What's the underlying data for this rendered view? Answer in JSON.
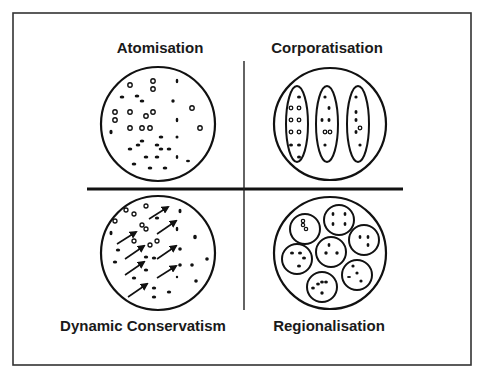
{
  "diagram": {
    "quadrants": [
      {
        "id": "top-left",
        "title": "Atomisation"
      },
      {
        "id": "top-right",
        "title": "Corporatisation"
      },
      {
        "id": "bottom-left",
        "title": "Dynamic Conservatism"
      },
      {
        "id": "bottom-right",
        "title": "Regionalisation"
      }
    ],
    "colors": {
      "stroke": "#1a1a1a",
      "background": "#ffffff",
      "frame": "#333333"
    }
  }
}
